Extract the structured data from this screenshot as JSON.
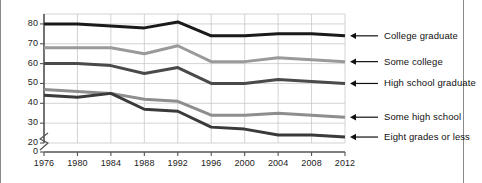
{
  "chart_data": {
    "type": "line",
    "title": "",
    "xlabel": "",
    "ylabel": "",
    "x": [
      1976,
      1980,
      1984,
      1988,
      1992,
      1996,
      2000,
      2004,
      2008,
      2012
    ],
    "xtick_labels": [
      "1976",
      "1980",
      "1984",
      "1988",
      "1992",
      "1996",
      "2000",
      "2004",
      "2008",
      "2012"
    ],
    "ytick_labels": [
      "0",
      "20",
      "30",
      "40",
      "50",
      "60",
      "70",
      "80"
    ],
    "ytick_values": [
      0,
      20,
      30,
      40,
      50,
      60,
      70,
      80
    ],
    "ylim": [
      20,
      85
    ],
    "xlim": [
      1976,
      2012
    ],
    "y_axis_break": true,
    "grid": true,
    "legend_position": "right-inline-arrows",
    "series": [
      {
        "name": "College graduate",
        "color": "#1a1a1a",
        "values": [
          80,
          80,
          79,
          78,
          81,
          74,
          74,
          75,
          75,
          74
        ]
      },
      {
        "name": "Some college",
        "color": "#9a9a9a",
        "values": [
          68,
          68,
          68,
          65,
          69,
          61,
          61,
          63,
          62,
          61
        ]
      },
      {
        "name": "High school graduate",
        "color": "#4a4a4a",
        "values": [
          60,
          60,
          59,
          55,
          58,
          50,
          50,
          52,
          51,
          50
        ]
      },
      {
        "name": "Some high school",
        "color": "#8e8e8e",
        "values": [
          47,
          46,
          45,
          42,
          41,
          34,
          34,
          35,
          34,
          33
        ]
      },
      {
        "name": "Eight grades or less",
        "color": "#3a3a3a",
        "values": [
          44,
          43,
          45,
          37,
          36,
          28,
          27,
          24,
          24,
          23
        ]
      }
    ]
  },
  "axis": {
    "break_symbol": "axis-break"
  }
}
